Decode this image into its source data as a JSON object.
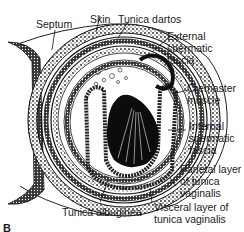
{
  "figure": {
    "panel_letter": "B",
    "labels": {
      "septum": "Septum",
      "skin": "Skin",
      "tunica_dartos": "Tunica dartos",
      "external_spermatic_fascia": [
        "External",
        "spermatic",
        "fascia"
      ],
      "cremaster_muscle": [
        "Cremaster",
        "muscle"
      ],
      "internal_spermatic_fascia": [
        "Internal",
        "spermatic",
        "fascia"
      ],
      "parietal_layer": [
        "Parietal layer",
        "of tunica",
        "vaginalis"
      ],
      "visceral_layer": [
        "Visceral layer of",
        "tunica vaginalis"
      ],
      "tunica_albuginea": "Tunica albuginea"
    },
    "colors": {
      "ink": "#111111",
      "background": "#ffffff"
    }
  }
}
